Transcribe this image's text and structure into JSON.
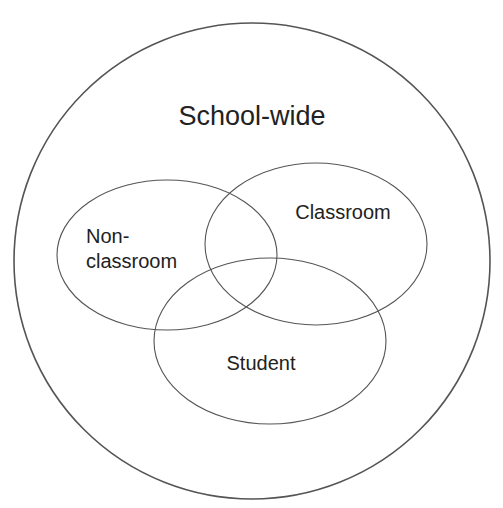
{
  "diagram": {
    "type": "venn",
    "outer": {
      "label": "School-wide",
      "shape": "circle",
      "cx": 252,
      "cy": 261,
      "r": 238,
      "label_x": 252,
      "label_y": 125,
      "font_size": 27
    },
    "sets": [
      {
        "id": "non-classroom",
        "label_lines": [
          "Non-",
          "classroom"
        ],
        "cx": 167,
        "cy": 255,
        "rx": 110,
        "ry": 75,
        "label_x": 86,
        "label_y": 243,
        "font_size": 20,
        "line_height": 25,
        "anchor": "start"
      },
      {
        "id": "classroom",
        "label_lines": [
          "Classroom"
        ],
        "cx": 316,
        "cy": 244,
        "rx": 111,
        "ry": 81,
        "label_x": 343,
        "label_y": 219,
        "font_size": 20,
        "line_height": 25,
        "anchor": "middle"
      },
      {
        "id": "student",
        "label_lines": [
          "Student"
        ],
        "cx": 270,
        "cy": 341,
        "rx": 116,
        "ry": 83,
        "label_x": 261,
        "label_y": 370,
        "font_size": 20,
        "line_height": 25,
        "anchor": "middle"
      }
    ],
    "stroke_color": "#555555",
    "text_color": "#222222",
    "background": "#ffffff"
  }
}
